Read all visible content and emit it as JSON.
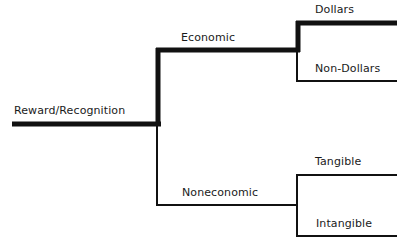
{
  "diagram": {
    "root": {
      "label": "Reward/Recognition"
    },
    "branches": [
      {
        "label": "Economic",
        "children": [
          {
            "label": "Dollars"
          },
          {
            "label": "Non-Dollars"
          }
        ]
      },
      {
        "label": "Noneconomic",
        "children": [
          {
            "label": "Tangible"
          },
          {
            "label": "Intangible"
          }
        ]
      }
    ],
    "colors": {
      "line": "#111111",
      "text": "#1a1a1a",
      "background": "#ffffff"
    }
  }
}
